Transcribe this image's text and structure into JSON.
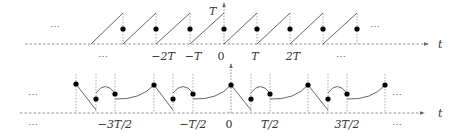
{
  "top_plot": {
    "axis_label": "t",
    "y_label": "T",
    "ellipsis_left_above": "⋯",
    "ellipsis_left_below": "⋯",
    "ellipsis_right_below": "⋯",
    "ticks": [
      {
        "label": "−2T",
        "x": 156
      },
      {
        "label": "−T",
        "x": 190
      },
      {
        "label": "0",
        "x": 224
      },
      {
        "label": "T",
        "x": 257
      },
      {
        "label": "2T",
        "x": 290
      }
    ]
  },
  "bottom_plot": {
    "axis_label": "t",
    "ellipsis_left_above": "⋯",
    "ellipsis_left_below": "⋯",
    "ellipsis_right_above": "⋯",
    "ellipsis_right_below": "⋯",
    "ticks": [
      {
        "label": "−3T/2",
        "x": 115
      },
      {
        "label": "−T/2",
        "x": 193
      },
      {
        "label": "0",
        "x": 231
      },
      {
        "label": "T/2",
        "x": 270
      },
      {
        "label": "3T/2",
        "x": 347
      }
    ]
  },
  "colors": {
    "line": "#555555",
    "dot": "#000000",
    "guide": "#888888"
  }
}
